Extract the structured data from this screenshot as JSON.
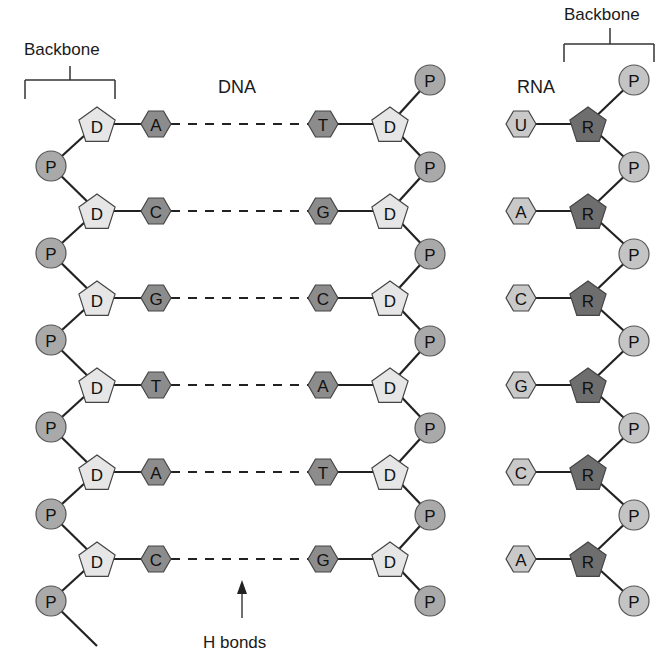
{
  "labels": {
    "backbone_left": "Backbone",
    "backbone_right": "Backbone",
    "dna_title": "DNA",
    "rna_title": "RNA",
    "hbonds": "H bonds"
  },
  "symbols": {
    "phosphate": "P",
    "deoxyribose": "D",
    "ribose": "R"
  },
  "colors": {
    "phosphate_fill": "#a9a9a9",
    "rna_phosphate_fill": "#c4c4c4",
    "deoxyribose_fill": "#e6e6e6",
    "ribose_fill": "#6e6e6e",
    "dna_base_fill": "#8c8c8c",
    "rna_base_fill": "#c9c9c9",
    "stroke": "#333333"
  },
  "dna": {
    "left_bases": [
      "A",
      "C",
      "G",
      "T",
      "A",
      "C"
    ],
    "right_bases": [
      "T",
      "G",
      "C",
      "A",
      "T",
      "G"
    ]
  },
  "rna": {
    "bases": [
      "U",
      "A",
      "C",
      "G",
      "C",
      "A"
    ]
  }
}
